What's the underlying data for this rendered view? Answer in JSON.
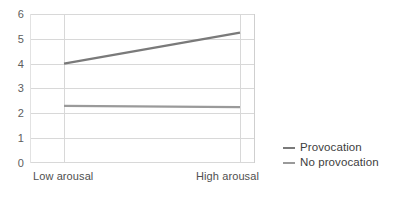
{
  "chart_data": {
    "type": "line",
    "title": "",
    "xlabel": "",
    "ylabel": "",
    "categories": [
      "Low arousal",
      "High arousal"
    ],
    "x": [
      0,
      1
    ],
    "xlim": [
      -0.2,
      1.1
    ],
    "ylim": [
      0,
      6
    ],
    "yticks": [
      0,
      1,
      2,
      3,
      4,
      5,
      6
    ],
    "ytick_labels": [
      "0",
      "1",
      "2",
      "3",
      "4",
      "5",
      "6"
    ],
    "grid": "horizontal-and-vertical",
    "legend_position": "right",
    "series": [
      {
        "name": "Provocation",
        "values": [
          4.0,
          5.25
        ],
        "color": "#7a7a7a"
      },
      {
        "name": "No provocation",
        "values": [
          2.3,
          2.25
        ],
        "color": "#9a9a9a"
      }
    ]
  },
  "axis": {
    "y_labels": [
      "6",
      "5",
      "4",
      "3",
      "2",
      "1",
      "0"
    ],
    "x_labels": {
      "low": "Low arousal",
      "high": "High arousal"
    }
  },
  "legend": {
    "items": [
      {
        "label": "Provocation",
        "swatch": "legend-line-swatch-provocation"
      },
      {
        "label": "No provocation",
        "swatch": "legend-line-swatch-no-provocation"
      }
    ]
  },
  "colors": {
    "provocation": "#7a7a7a",
    "no_provocation": "#9a9a9a",
    "gridline": "#d8d8d8",
    "tick_text": "#5d5d5d",
    "background": "#ffffff"
  }
}
